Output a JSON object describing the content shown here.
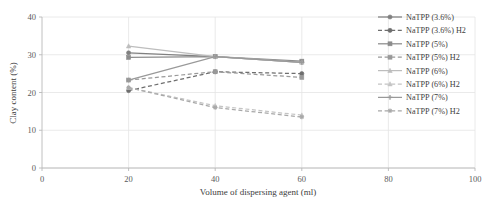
{
  "chart_data": {
    "type": "line",
    "title": "",
    "xlabel": "Volume of dispersing agent (ml)",
    "ylabel": "Clay content (%)",
    "x": [
      20,
      40,
      60
    ],
    "xlim": [
      0,
      100
    ],
    "ylim": [
      0,
      40
    ],
    "xticks": [
      0,
      20,
      40,
      60,
      80,
      100
    ],
    "yticks": [
      0,
      10,
      20,
      30,
      40
    ],
    "xtick_labels": [
      "0",
      "20",
      "40",
      "60",
      "80",
      "100"
    ],
    "ytick_labels": [
      "0",
      "10",
      "20",
      "30",
      "40"
    ],
    "grid": "horizontal-and-vertical-light",
    "legend_position": "right",
    "series": [
      {
        "name": "NaTPP (3.6%)",
        "values": [
          30.5,
          29.5,
          28.0
        ],
        "color": "#808080",
        "style": "solid",
        "marker": "circle"
      },
      {
        "name": "NaTPP (3.6%) H2",
        "values": [
          20.5,
          25.5,
          25.0
        ],
        "color": "#6e6e6e",
        "style": "dashed",
        "marker": "circle"
      },
      {
        "name": "NaTPP (5%)",
        "values": [
          29.3,
          29.5,
          28.3
        ],
        "color": "#8c8c8c",
        "style": "solid",
        "marker": "square"
      },
      {
        "name": "NaTPP (5%) H2",
        "values": [
          23.3,
          25.5,
          24.0
        ],
        "color": "#999999",
        "style": "dashed",
        "marker": "square"
      },
      {
        "name": "NaTPP (6%)",
        "values": [
          32.3,
          29.5,
          28.0
        ],
        "color": "#bdbdbd",
        "style": "solid",
        "marker": "triangle"
      },
      {
        "name": "NaTPP (6%) H2",
        "values": [
          21.3,
          16.5,
          14.0
        ],
        "color": "#c4c4c4",
        "style": "dashed",
        "marker": "triangle"
      },
      {
        "name": "NaTPP (7%)",
        "values": [
          23.3,
          29.5,
          28.0
        ],
        "color": "#999999",
        "style": "solid",
        "marker": "cross"
      },
      {
        "name": "NaTPP (7%) H2",
        "values": [
          21.3,
          16.0,
          13.5
        ],
        "color": "#a8a8a8",
        "style": "dashed",
        "marker": "star"
      }
    ]
  },
  "colors": {
    "background": "#ffffff",
    "grid": "#e4e4e4",
    "axis": "#b9b9b9",
    "text": "#3d3d3d",
    "tick_text": "#5a5a5a"
  }
}
